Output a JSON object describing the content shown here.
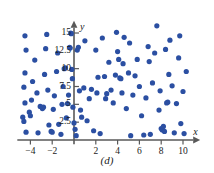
{
  "figure": {
    "caption": "(d)",
    "background_color": "#ffffff",
    "axis_color": "#595959",
    "point_color": "#2b4fa2"
  },
  "chart_data": {
    "type": "scatter",
    "title": "",
    "subtitle": "",
    "xlabel": "x",
    "ylabel": "y",
    "xlim": [
      -5.2,
      11.3
    ],
    "ylim": [
      -0.6,
      16.3
    ],
    "grid": false,
    "legend": null,
    "annotations": [
      "(d)"
    ],
    "xticks": [
      -4,
      -2,
      2,
      4,
      6,
      8,
      10
    ],
    "xtick_labels": [
      "−4",
      "−2",
      "2",
      "4",
      "6",
      "8",
      "10"
    ],
    "yticks": [
      2.5,
      5,
      7.5,
      10,
      12.5,
      15
    ],
    "ytick_labels": [
      "2.5",
      "5",
      "7.5",
      "10",
      "12.5",
      "15"
    ],
    "marker": "circle",
    "marker_size": 4,
    "series": [
      {
        "name": "data",
        "color": "#2b4fa2",
        "points": [
          [
            -4.5,
            14.6
          ],
          [
            -4.4,
            12.6
          ],
          [
            -4.5,
            9.4
          ],
          [
            -4.6,
            7.4
          ],
          [
            -4.5,
            5.2
          ],
          [
            -4.7,
            3.2
          ],
          [
            -4.6,
            2.6
          ],
          [
            -4.4,
            1.1
          ],
          [
            -4.1,
            3.9
          ],
          [
            -4.0,
            3.4
          ],
          [
            -3.9,
            5.6
          ],
          [
            -3.8,
            8.2
          ],
          [
            -3.6,
            11.2
          ],
          [
            -3.4,
            6.6
          ],
          [
            -3.3,
            1.0
          ],
          [
            -3.1,
            4.7
          ],
          [
            -2.9,
            4.4
          ],
          [
            -2.8,
            4.6
          ],
          [
            -2.7,
            9.2
          ],
          [
            -2.6,
            12.8
          ],
          [
            -2.5,
            14.8
          ],
          [
            -2.4,
            7.0
          ],
          [
            -2.3,
            2.1
          ],
          [
            -2.1,
            1.2
          ],
          [
            -2.0,
            1.1
          ],
          [
            -1.9,
            4.3
          ],
          [
            -1.8,
            6.2
          ],
          [
            -1.6,
            9.6
          ],
          [
            -1.5,
            12.2
          ],
          [
            -1.4,
            2.2
          ],
          [
            -1.2,
            0.8
          ],
          [
            -1.1,
            5.0
          ],
          [
            -1.0,
            7.5
          ],
          [
            -0.9,
            10.0
          ],
          [
            -0.8,
            10.1
          ],
          [
            -0.7,
            3.1
          ],
          [
            -0.6,
            5.1
          ],
          [
            -0.5,
            6.3
          ],
          [
            -0.4,
            13.0
          ],
          [
            -0.35,
            12.9
          ],
          [
            -0.3,
            15.0
          ],
          [
            -0.25,
            14.9
          ],
          [
            -0.2,
            9.9
          ],
          [
            -0.15,
            8.6
          ],
          [
            -0.1,
            4.6
          ],
          [
            0.0,
            2.4
          ],
          [
            0.1,
            1.5
          ],
          [
            0.2,
            0.6
          ],
          [
            0.3,
            12.6
          ],
          [
            0.4,
            13.0
          ],
          [
            0.5,
            6.9
          ],
          [
            0.6,
            4.2
          ],
          [
            0.7,
            3.2
          ],
          [
            0.9,
            7.3
          ],
          [
            1.0,
            13.9
          ],
          [
            1.2,
            2.7
          ],
          [
            1.4,
            5.8
          ],
          [
            1.6,
            7.1
          ],
          [
            1.8,
            1.3
          ],
          [
            2.0,
            12.6
          ],
          [
            2.1,
            6.6
          ],
          [
            2.2,
            8.8
          ],
          [
            2.4,
            0.9
          ],
          [
            2.6,
            14.3
          ],
          [
            2.8,
            8.9
          ],
          [
            2.9,
            5.8
          ],
          [
            3.0,
            6.5
          ],
          [
            3.2,
            10.9
          ],
          [
            3.4,
            7.0
          ],
          [
            3.6,
            5.2
          ],
          [
            3.8,
            9.1
          ],
          [
            3.9,
            15.1
          ],
          [
            4.0,
            12.4
          ],
          [
            4.1,
            11.3
          ],
          [
            4.2,
            8.7
          ],
          [
            4.3,
            8.6
          ],
          [
            4.4,
            6.6
          ],
          [
            4.5,
            10.7
          ],
          [
            4.6,
            14.4
          ],
          [
            4.8,
            4.4
          ],
          [
            5.0,
            9.4
          ],
          [
            5.1,
            13.6
          ],
          [
            5.2,
            0.6
          ],
          [
            5.4,
            6.3
          ],
          [
            5.6,
            9.0
          ],
          [
            5.8,
            11.3
          ],
          [
            6.0,
            7.5
          ],
          [
            6.2,
            3.4
          ],
          [
            6.4,
            0.7
          ],
          [
            6.6,
            5.9
          ],
          [
            6.8,
            13.1
          ],
          [
            6.9,
            11.0
          ],
          [
            7.0,
            0.8
          ],
          [
            7.2,
            8.0
          ],
          [
            7.4,
            12.2
          ],
          [
            7.6,
            16.0
          ],
          [
            7.8,
            4.2
          ],
          [
            7.9,
            6.9
          ],
          [
            8.0,
            1.6
          ],
          [
            8.1,
            1.4
          ],
          [
            8.2,
            1.9
          ],
          [
            8.3,
            1.2
          ],
          [
            8.4,
            12.7
          ],
          [
            8.5,
            5.2
          ],
          [
            8.6,
            5.3
          ],
          [
            8.7,
            9.2
          ],
          [
            8.8,
            14.0
          ],
          [
            9.0,
            7.6
          ],
          [
            9.2,
            1.0
          ],
          [
            9.4,
            5.1
          ],
          [
            9.6,
            11.5
          ],
          [
            9.7,
            14.6
          ],
          [
            9.8,
            2.3
          ],
          [
            10.0,
            6.8
          ],
          [
            10.1,
            0.9
          ],
          [
            10.3,
            9.6
          ]
        ]
      }
    ]
  }
}
